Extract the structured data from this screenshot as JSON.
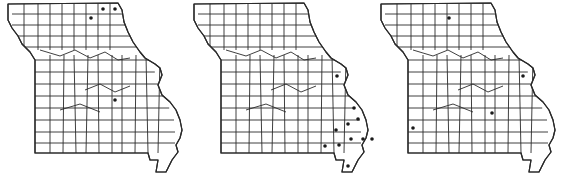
{
  "figure": {
    "type": "county distribution maps",
    "region": "Missouri",
    "panel_count": 3,
    "colors": {
      "border": "#2a2a2a",
      "dot": "#1a1a1a",
      "background": "#ffffff"
    }
  },
  "maps": [
    {
      "id": "map-1",
      "offset_x": 0,
      "dots": [
        [
          91,
          18
        ],
        [
          103,
          9
        ],
        [
          115,
          9
        ],
        [
          115,
          100
        ]
      ]
    },
    {
      "id": "map-2",
      "offset_x": 186,
      "dots": [
        [
          337,
          76
        ],
        [
          354,
          108
        ],
        [
          358,
          119
        ],
        [
          348,
          124
        ],
        [
          336,
          130
        ],
        [
          351,
          139
        ],
        [
          325,
          146
        ],
        [
          339,
          145
        ],
        [
          363,
          139
        ],
        [
          372,
          139
        ],
        [
          348,
          166
        ]
      ]
    },
    {
      "id": "map-3",
      "offset_x": 373,
      "dots": [
        [
          449,
          18
        ],
        [
          523,
          76
        ],
        [
          492,
          113
        ],
        [
          413,
          128
        ]
      ]
    }
  ]
}
